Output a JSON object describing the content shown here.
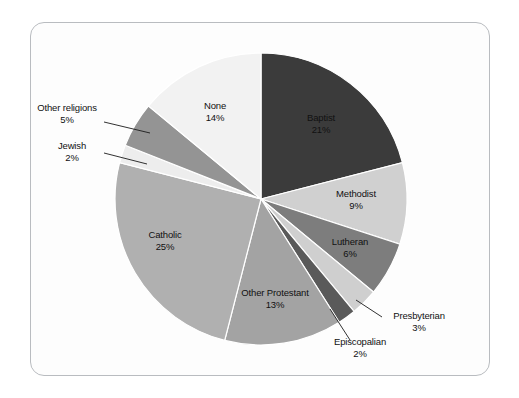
{
  "figure": {
    "frame_color": "#b9bcc0",
    "background": "#fdfdfd",
    "page_background": "#ffffff"
  },
  "chart_data": {
    "type": "pie",
    "title": "",
    "subtitle": "",
    "xlabel": "",
    "ylabel": "",
    "legend_position": "none",
    "grid": false,
    "start_angle_deg": 0,
    "direction": "clockwise",
    "units": "percent",
    "total": 100,
    "categories": [
      "Baptist",
      "Methodist",
      "Lutheran",
      "Presbyterian",
      "Episcopalian",
      "Other Protestant",
      "Catholic",
      "Jewish",
      "Other religions",
      "None"
    ],
    "values": [
      21,
      9,
      6,
      3,
      2,
      13,
      25,
      2,
      5,
      14
    ],
    "value_labels": [
      "21%",
      "9%",
      "6%",
      "3%",
      "2%",
      "13%",
      "25%",
      "2%",
      "5%",
      "14%"
    ],
    "colors": [
      "#3b3b3b",
      "#d0d0d0",
      "#7d7d7d",
      "#cfcfcf",
      "#5a5a5a",
      "#a3a3a3",
      "#b0b0b0",
      "#ededed",
      "#949494",
      "#f2f2f2"
    ],
    "slices": [
      {
        "name": "Baptist",
        "value": 21,
        "pct_label": "21%",
        "color": "#3b3b3b",
        "label_placement": "inside",
        "leader_line": false
      },
      {
        "name": "Methodist",
        "value": 9,
        "pct_label": "9%",
        "color": "#d0d0d0",
        "label_placement": "inside",
        "leader_line": false
      },
      {
        "name": "Lutheran",
        "value": 6,
        "pct_label": "6%",
        "color": "#7d7d7d",
        "label_placement": "inside",
        "leader_line": false
      },
      {
        "name": "Presbyterian",
        "value": 3,
        "pct_label": "3%",
        "color": "#cfcfcf",
        "label_placement": "outside",
        "leader_line": true
      },
      {
        "name": "Episcopalian",
        "value": 2,
        "pct_label": "2%",
        "color": "#5a5a5a",
        "label_placement": "outside",
        "leader_line": true
      },
      {
        "name": "Other Protestant",
        "value": 13,
        "pct_label": "13%",
        "color": "#a3a3a3",
        "label_placement": "inside",
        "leader_line": false
      },
      {
        "name": "Catholic",
        "value": 25,
        "pct_label": "25%",
        "color": "#b0b0b0",
        "label_placement": "inside",
        "leader_line": false
      },
      {
        "name": "Jewish",
        "value": 2,
        "pct_label": "2%",
        "color": "#ededed",
        "label_placement": "outside",
        "leader_line": true
      },
      {
        "name": "Other religions",
        "value": 5,
        "pct_label": "5%",
        "color": "#949494",
        "label_placement": "outside",
        "leader_line": true
      },
      {
        "name": "None",
        "value": 14,
        "pct_label": "14%",
        "color": "#f2f2f2",
        "label_placement": "inside",
        "leader_line": false
      }
    ]
  },
  "labels": {
    "baptist": {
      "name": "Baptist",
      "pct": "21%"
    },
    "methodist": {
      "name": "Methodist",
      "pct": "9%"
    },
    "lutheran": {
      "name": "Lutheran",
      "pct": "6%"
    },
    "presbyterian": {
      "name": "Presbyterian",
      "pct": "3%"
    },
    "episcopalian": {
      "name": "Episcopalian",
      "pct": "2%"
    },
    "other_protestant": {
      "name": "Other Protestant",
      "pct": "13%"
    },
    "catholic": {
      "name": "Catholic",
      "pct": "25%"
    },
    "jewish": {
      "name": "Jewish",
      "pct": "2%"
    },
    "other_religions": {
      "name": "Other religions",
      "pct": "5%"
    },
    "none": {
      "name": "None",
      "pct": "14%"
    }
  }
}
